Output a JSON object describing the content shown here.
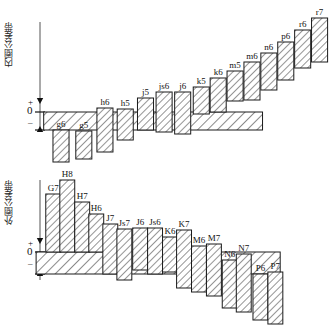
{
  "diagram": {
    "title_inner": "内圈公差带",
    "title_outer": "外圈公差带",
    "axis_marks": {
      "plus": "+",
      "zero": "0",
      "minus": "–"
    },
    "colors": {
      "line": "#1a1a1a",
      "hatch": "#333333",
      "fill": "#ffffff",
      "background": "#ffffff"
    }
  },
  "chart_data": [
    {
      "type": "bar",
      "title": "内圈公差带",
      "id": "inner",
      "xlabel": "",
      "ylabel": "",
      "zero_line": "0",
      "note": "Shaft tolerance zones relative to zero line; y in px from zero line, positive above",
      "band": {
        "label": "",
        "x": 44,
        "width": 259,
        "top": 0,
        "bottom": -22
      },
      "categories": [
        "g6",
        "g5",
        "h6",
        "h5",
        "j5",
        "js6",
        "j6",
        "k5",
        "k6",
        "m5",
        "m6",
        "n6",
        "p6",
        "r6",
        "r7"
      ],
      "series": [
        {
          "name": "tolerance zone",
          "values": [
            {
              "label": "g6",
              "x": 55,
              "w": 19,
              "top": -18,
              "bottom": -50
            },
            {
              "label": "g5",
              "x": 82,
              "w": 19,
              "top": -19,
              "bottom": -47
            },
            {
              "label": "h6",
              "x": 107,
              "w": 19,
              "top": 4,
              "bottom": -40
            },
            {
              "label": "h5",
              "x": 131,
              "w": 19,
              "top": 3,
              "bottom": -28
            },
            {
              "label": "j5",
              "x": 155,
              "w": 19,
              "top": 14,
              "bottom": -18
            },
            {
              "label": "js6",
              "x": 177,
              "w": 19,
              "top": 20,
              "bottom": -20
            },
            {
              "label": "j6",
              "x": 199,
              "w": 19,
              "top": 20,
              "bottom": -22
            },
            {
              "label": "k5",
              "x": 221,
              "w": 19,
              "top": 25,
              "bottom": -2
            },
            {
              "label": "k6",
              "x": 241,
              "w": 19,
              "top": 34,
              "bottom": 0
            },
            {
              "label": "m5",
              "x": 261,
              "w": 19,
              "top": 41,
              "bottom": 11
            },
            {
              "label": "m6",
              "x": 281,
              "w": 19,
              "top": 50,
              "bottom": 12
            },
            {
              "label": "n6",
              "x": 301,
              "w": 19,
              "top": 59,
              "bottom": 22
            },
            {
              "label": "p6",
              "x": 321,
              "w": 19,
              "top": 70,
              "bottom": 32
            },
            {
              "label": "r6",
              "x": 341,
              "w": 19,
              "top": 82,
              "bottom": 44
            },
            {
              "label": "r7",
              "x": 361,
              "w": 19,
              "top": 94,
              "bottom": 50
            }
          ]
        }
      ]
    },
    {
      "type": "bar",
      "title": "外圈公差带",
      "id": "outer",
      "xlabel": "",
      "ylabel": "",
      "zero_line": "0",
      "note": "Housing tolerance zones relative to zero line; positive above",
      "band": {
        "label": "",
        "x": 36,
        "width": 278,
        "top": 0,
        "bottom": -26
      },
      "categories": [
        "G7",
        "H8",
        "H7",
        "H6",
        "J7",
        "Js7",
        "J6",
        "Js6",
        "K6",
        "K7",
        "M6",
        "M7",
        "N6",
        "N7",
        "P6",
        "P7"
      ],
      "series": [
        {
          "name": "tolerance zone",
          "values": [
            {
              "label": "G7",
              "x": 47,
              "w": 17,
              "top": 58,
              "bottom": 0
            },
            {
              "label": "H8",
              "x": 63,
              "w": 17,
              "top": 72,
              "bottom": 0
            },
            {
              "label": "H7",
              "x": 80,
              "w": 17,
              "top": 50,
              "bottom": 0
            },
            {
              "label": "H6",
              "x": 96,
              "w": 17,
              "top": 38,
              "bottom": 0
            },
            {
              "label": "J7",
              "x": 112,
              "w": 17,
              "top": 28,
              "bottom": -22
            },
            {
              "label": "Js7",
              "x": 128,
              "w": 17,
              "top": 23,
              "bottom": -28
            },
            {
              "label": "J6",
              "x": 146,
              "w": 17,
              "top": 24,
              "bottom": -18
            },
            {
              "label": "Js6",
              "x": 163,
              "w": 17,
              "top": 24,
              "bottom": -22
            },
            {
              "label": "K6",
              "x": 180,
              "w": 17,
              "top": 15,
              "bottom": -20
            },
            {
              "label": "K7",
              "x": 196,
              "w": 17,
              "top": 22,
              "bottom": -36
            },
            {
              "label": "M6",
              "x": 213,
              "w": 17,
              "top": 6,
              "bottom": -40
            },
            {
              "label": "M7",
              "x": 230,
              "w": 17,
              "top": 8,
              "bottom": -44
            },
            {
              "label": "N6",
              "x": 248,
              "w": 17,
              "top": -8,
              "bottom": -56
            },
            {
              "label": "N7",
              "x": 264,
              "w": 17,
              "top": -2,
              "bottom": -60
            },
            {
              "label": "P6",
              "x": 283,
              "w": 17,
              "top": -22,
              "bottom": -68
            },
            {
              "label": "P7",
              "x": 300,
              "w": 17,
              "top": -20,
              "bottom": -72
            }
          ]
        }
      ]
    }
  ]
}
